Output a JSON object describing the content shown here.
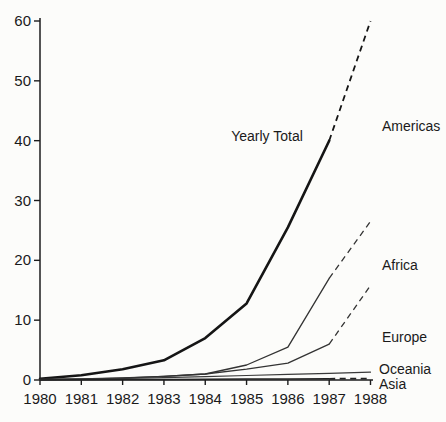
{
  "figure": {
    "description_colors": {
      "background": "#fcfcfa",
      "axis": "#1c1c1c",
      "thick_line": "#151515",
      "thin_line": "#333333",
      "text": "#1a1a1a"
    }
  },
  "chart_data": {
    "type": "line",
    "title": "",
    "xlabel": "",
    "ylabel": "",
    "xlim": [
      1980,
      1988
    ],
    "ylim": [
      0,
      60
    ],
    "grid": false,
    "legend_position": "right-inline-labels",
    "x_ticks": [
      1980,
      1981,
      1982,
      1983,
      1984,
      1985,
      1986,
      1987,
      1988
    ],
    "x_tick_labels": [
      "1980",
      "1981",
      "1982",
      "1983",
      "1984",
      "1985",
      "1986",
      "1987",
      "1988"
    ],
    "y_ticks": [
      0,
      10,
      20,
      30,
      40,
      50,
      60
    ],
    "y_tick_labels": [
      "0",
      "10",
      "20",
      "30",
      "40",
      "50",
      "60"
    ],
    "dashed_note": "dashed segments are 1987-1988 projections",
    "series": [
      {
        "name": "Yearly Total",
        "stroke": "#151515",
        "width": 2.6,
        "dash_width": 1.8,
        "solid": {
          "x": [
            1980,
            1981,
            1982,
            1983,
            1984,
            1985,
            1986,
            1987
          ],
          "y": [
            0.2,
            0.8,
            1.8,
            3.3,
            7,
            12.8,
            25.5,
            40
          ]
        },
        "dashed": {
          "x": [
            1987,
            1988
          ],
          "y": [
            40,
            60
          ]
        }
      },
      {
        "name": "Africa",
        "stroke": "#333333",
        "width": 1.3,
        "dash_width": 1.3,
        "solid": {
          "x": [
            1980,
            1981,
            1982,
            1983,
            1984,
            1985,
            1986,
            1987
          ],
          "y": [
            0.1,
            0.15,
            0.3,
            0.6,
            1.0,
            2.5,
            5.5,
            17
          ]
        },
        "dashed": {
          "x": [
            1987,
            1988
          ],
          "y": [
            17,
            26.5
          ]
        }
      },
      {
        "name": "Europe",
        "stroke": "#333333",
        "width": 1.3,
        "dash_width": 1.3,
        "solid": {
          "x": [
            1980,
            1981,
            1982,
            1983,
            1984,
            1985,
            1986,
            1987
          ],
          "y": [
            0.1,
            0.2,
            0.35,
            0.6,
            1.0,
            1.8,
            2.8,
            6.0
          ]
        },
        "dashed": {
          "x": [
            1987,
            1988
          ],
          "y": [
            6.0,
            15.8
          ]
        }
      },
      {
        "name": "Oceania",
        "stroke": "#3a3a3a",
        "width": 1.2,
        "dash_width": 1.2,
        "solid": {
          "x": [
            1980,
            1981,
            1982,
            1983,
            1984,
            1985,
            1986,
            1987,
            1988
          ],
          "y": [
            0.05,
            0.15,
            0.25,
            0.4,
            0.55,
            0.75,
            0.95,
            1.1,
            1.3
          ]
        },
        "dashed": null
      },
      {
        "name": "Asia",
        "stroke": "#222222",
        "width": 1.5,
        "dash_width": 1.8,
        "solid": {
          "x": [
            1980,
            1981,
            1982,
            1983,
            1984,
            1985,
            1986,
            1987
          ],
          "y": [
            0.02,
            0.05,
            0.08,
            0.1,
            0.12,
            0.15,
            0.18,
            0.2
          ]
        },
        "dashed": {
          "x": [
            1987,
            1988
          ],
          "y": [
            0.2,
            0.25
          ]
        }
      }
    ],
    "annotations": [
      {
        "text": "Yearly Total",
        "x": 267,
        "y": 141,
        "anchor": "middle"
      },
      {
        "text": "Americas",
        "x": 382,
        "y": 131,
        "anchor": "start"
      },
      {
        "text": "Africa",
        "x": 382,
        "y": 270,
        "anchor": "start"
      },
      {
        "text": "Europe",
        "x": 382,
        "y": 342,
        "anchor": "start"
      },
      {
        "text": "Oceania",
        "x": 379,
        "y": 374,
        "anchor": "start"
      },
      {
        "text": "Asia",
        "x": 379,
        "y": 389,
        "anchor": "start"
      }
    ]
  }
}
